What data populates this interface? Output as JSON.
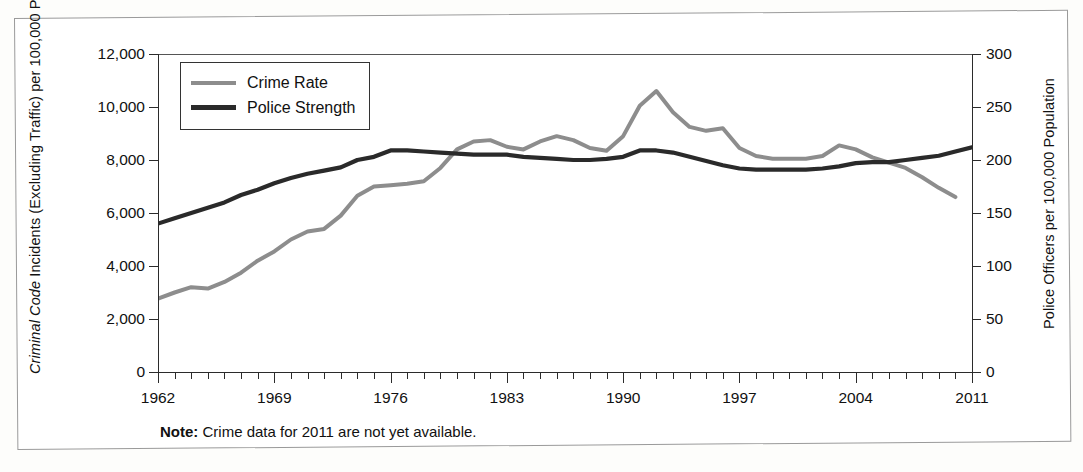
{
  "axes": {
    "left_title_italic": "Criminal Code",
    "left_title_rest": " Incidents (Excluding Traffic) per 100,000 Population",
    "right_title": "Police Officers per 100,000 Population"
  },
  "legend": {
    "items": [
      {
        "label": "Crime Rate",
        "color": "#8d8d8d"
      },
      {
        "label": "Police Strength",
        "color": "#2a2a2a"
      }
    ]
  },
  "note": {
    "prefix": "Note:",
    "text": " Crime data for 2011 are not yet available."
  },
  "chart_data": {
    "type": "line",
    "title": "",
    "xlabel": "",
    "ylabel": "Criminal Code Incidents (Excluding Traffic) per 100,000 Population",
    "y2label": "Police Officers per 100,000 Population",
    "xlim": [
      1962,
      2011
    ],
    "ylim": [
      0,
      12000
    ],
    "y2lim": [
      0,
      300
    ],
    "yticks": [
      0,
      2000,
      4000,
      6000,
      8000,
      10000,
      12000
    ],
    "ytick_labels": [
      "0",
      "2,000",
      "4,000",
      "6,000",
      "8,000",
      "10,000",
      "12,000"
    ],
    "y2ticks": [
      0,
      50,
      100,
      150,
      200,
      250,
      300
    ],
    "y2tick_labels": [
      "0",
      "50",
      "100",
      "150",
      "200",
      "250",
      "300"
    ],
    "xticks": [
      1962,
      1969,
      1976,
      1983,
      1990,
      1997,
      2004,
      2011
    ],
    "xtick_labels": [
      "1962",
      "1969",
      "1976",
      "1983",
      "1990",
      "1997",
      "2004",
      "2011"
    ],
    "minor_xticks_every": 1,
    "grid": false,
    "legend_position": "upper left",
    "x": [
      1962,
      1963,
      1964,
      1965,
      1966,
      1967,
      1968,
      1969,
      1970,
      1971,
      1972,
      1973,
      1974,
      1975,
      1976,
      1977,
      1978,
      1979,
      1980,
      1981,
      1982,
      1983,
      1984,
      1985,
      1986,
      1987,
      1988,
      1989,
      1990,
      1991,
      1992,
      1993,
      1994,
      1995,
      1996,
      1997,
      1998,
      1999,
      2000,
      2001,
      2002,
      2003,
      2004,
      2005,
      2006,
      2007,
      2008,
      2009,
      2010,
      2011
    ],
    "series": [
      {
        "name": "Crime Rate",
        "axis": "left",
        "color": "#8d8d8d",
        "values": [
          2771,
          3000,
          3200,
          3150,
          3400,
          3750,
          4200,
          4550,
          5000,
          5300,
          5400,
          5900,
          6650,
          7000,
          7050,
          7100,
          7200,
          7700,
          8400,
          8700,
          8750,
          8500,
          8400,
          8700,
          8900,
          8750,
          8450,
          8350,
          8900,
          10050,
          10600,
          9800,
          9250,
          9100,
          9200,
          8450,
          8150,
          8050,
          8050,
          8050,
          8150,
          8550,
          8400,
          8100,
          7900,
          7700,
          7350,
          6950,
          6600,
          null
        ]
      },
      {
        "name": "Police Strength",
        "axis": "right",
        "color": "#2a2a2a",
        "values_right_scale": [
          140,
          145,
          150,
          155,
          160,
          167,
          172,
          178,
          183,
          187,
          190,
          193,
          200,
          203,
          209,
          209,
          208,
          207,
          206,
          205,
          205,
          205,
          203,
          202,
          201,
          200,
          200,
          201,
          203,
          209,
          209,
          207,
          203,
          199,
          195,
          192,
          191,
          191,
          191,
          191,
          192,
          194,
          197,
          198,
          198,
          200,
          202,
          204,
          208,
          212
        ],
        "values_left_equiv": [
          5600,
          5800,
          6000,
          6200,
          6400,
          6680,
          6880,
          7120,
          7320,
          7480,
          7600,
          7720,
          8000,
          8120,
          8360,
          8360,
          8320,
          8280,
          8240,
          8200,
          8200,
          8200,
          8120,
          8080,
          8040,
          8000,
          8000,
          8040,
          8120,
          8360,
          8360,
          8280,
          8120,
          7960,
          7800,
          7680,
          7640,
          7640,
          7640,
          7640,
          7680,
          7760,
          7880,
          7920,
          7920,
          8000,
          8080,
          8160,
          8320,
          8480
        ]
      }
    ]
  }
}
